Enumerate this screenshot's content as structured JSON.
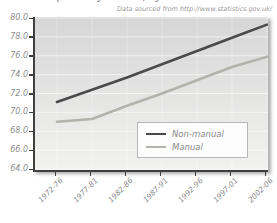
{
  "page": {
    "title_partial": "Life expectancy at birth, by social class",
    "source_note": "Data sourced from http://www.statistics.gov.uk/"
  },
  "chart_data": {
    "type": "line",
    "title": "",
    "xlabel": "",
    "ylabel": "",
    "categories": [
      "1972-76",
      "1977-81",
      "1982-86",
      "1987-91",
      "1992-96",
      "1997-01",
      "2002-06"
    ],
    "series": [
      {
        "name": "Non-manual",
        "color": "#4a4a4a",
        "values": [
          71.1,
          72.4,
          73.7,
          75.1,
          76.5,
          77.9,
          79.3
        ]
      },
      {
        "name": "Manual",
        "color": "#b3b3ad",
        "values": [
          69.0,
          69.3,
          70.7,
          72.0,
          73.4,
          74.8,
          75.9
        ]
      }
    ],
    "ylim": [
      64.0,
      80.0
    ],
    "ytick_step": 2.0,
    "ytick_labels": [
      "80.0",
      "78.0",
      "76.0",
      "74.0",
      "72.0",
      "70.0",
      "68.0",
      "66.0",
      "64.0"
    ],
    "grid": true,
    "legend_position": "lower right",
    "colors": {
      "axis": "#3f3f3f",
      "tick_text": "#8e8e8e",
      "panel_top": "#d6d6d6",
      "panel_bottom": "#f2f2f1",
      "gridline": "rgba(255,255,255,0.55)",
      "legend_border": "#b8b8b8"
    }
  }
}
